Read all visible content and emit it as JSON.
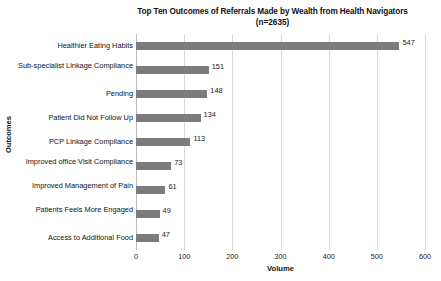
{
  "chart_data": {
    "type": "bar",
    "orientation": "horizontal",
    "title": "Top Ten Outcomes of Referrals Made by Wealth from Health Navigators",
    "subtitle": "(n=2635)",
    "xlabel": "Volume",
    "ylabel": "Outcomes",
    "categories": [
      "Healthier Eating Habits",
      "Sub-specialist Linkage Compliance",
      "Pending",
      "Patient Did Not Follow Up",
      "PCP Linkage Compliance",
      "Improved office Visit Compliance",
      "Improved Management of Pain",
      "Patients Feels More Engaged",
      "Access to Additional Food"
    ],
    "values": [
      547,
      151,
      148,
      134,
      113,
      73,
      61,
      49,
      47
    ],
    "xlim": [
      0,
      600
    ],
    "xticks": [
      0,
      100,
      200,
      300,
      400,
      500,
      600
    ],
    "xtick_labels": [
      "0",
      "100",
      "200",
      "300",
      "400",
      "500",
      "600"
    ],
    "grid": "vertical",
    "legend": "none",
    "bar_color": "#7c7c7c",
    "gridline_color": "#d9d9d9",
    "data_labels": [
      "547",
      "151",
      "148",
      "134",
      "113",
      "73",
      "61",
      "49",
      "47"
    ]
  }
}
